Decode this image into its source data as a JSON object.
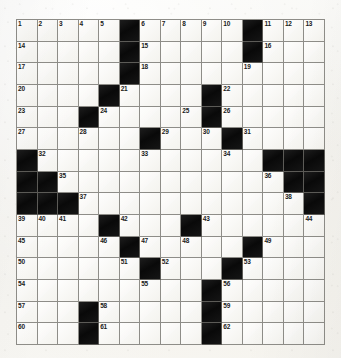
{
  "puzzle": {
    "title": "Crossword Puzzle Grid",
    "rows": 15,
    "columns": 15,
    "block_color": "#111111",
    "cell_color": "#f6f5f1",
    "grid_line_color": "#8e8d88",
    "paper_color": "#f7f6f2",
    "clue_number_color": "#1a1a1a",
    "total_clue_numbers": 62,
    "grid": [
      [
        {
          "type": "white",
          "number": "1"
        },
        {
          "type": "white",
          "number": "2"
        },
        {
          "type": "white",
          "number": "3"
        },
        {
          "type": "white",
          "number": "4"
        },
        {
          "type": "white",
          "number": "5"
        },
        {
          "type": "block",
          "number": ""
        },
        {
          "type": "white",
          "number": "6"
        },
        {
          "type": "white",
          "number": "7"
        },
        {
          "type": "white",
          "number": "8"
        },
        {
          "type": "white",
          "number": "9"
        },
        {
          "type": "white",
          "number": "10"
        },
        {
          "type": "block",
          "number": ""
        },
        {
          "type": "white",
          "number": "11"
        },
        {
          "type": "white",
          "number": "12"
        },
        {
          "type": "white",
          "number": "13"
        }
      ],
      [
        {
          "type": "white",
          "number": "14"
        },
        {
          "type": "white",
          "number": ""
        },
        {
          "type": "white",
          "number": ""
        },
        {
          "type": "white",
          "number": ""
        },
        {
          "type": "white",
          "number": ""
        },
        {
          "type": "block",
          "number": ""
        },
        {
          "type": "white",
          "number": "15"
        },
        {
          "type": "white",
          "number": ""
        },
        {
          "type": "white",
          "number": ""
        },
        {
          "type": "white",
          "number": ""
        },
        {
          "type": "white",
          "number": ""
        },
        {
          "type": "block",
          "number": ""
        },
        {
          "type": "white",
          "number": "16"
        },
        {
          "type": "white",
          "number": ""
        },
        {
          "type": "white",
          "number": ""
        }
      ],
      [
        {
          "type": "white",
          "number": "17"
        },
        {
          "type": "white",
          "number": ""
        },
        {
          "type": "white",
          "number": ""
        },
        {
          "type": "white",
          "number": ""
        },
        {
          "type": "white",
          "number": ""
        },
        {
          "type": "block",
          "number": ""
        },
        {
          "type": "white",
          "number": "18"
        },
        {
          "type": "white",
          "number": ""
        },
        {
          "type": "white",
          "number": ""
        },
        {
          "type": "white",
          "number": ""
        },
        {
          "type": "white",
          "number": ""
        },
        {
          "type": "white",
          "number": "19"
        },
        {
          "type": "white",
          "number": ""
        },
        {
          "type": "white",
          "number": ""
        },
        {
          "type": "white",
          "number": ""
        }
      ],
      [
        {
          "type": "white",
          "number": "20"
        },
        {
          "type": "white",
          "number": ""
        },
        {
          "type": "white",
          "number": ""
        },
        {
          "type": "white",
          "number": ""
        },
        {
          "type": "block",
          "number": ""
        },
        {
          "type": "white",
          "number": "21"
        },
        {
          "type": "white",
          "number": ""
        },
        {
          "type": "white",
          "number": ""
        },
        {
          "type": "white",
          "number": ""
        },
        {
          "type": "block",
          "number": ""
        },
        {
          "type": "white",
          "number": "22"
        },
        {
          "type": "white",
          "number": ""
        },
        {
          "type": "white",
          "number": ""
        },
        {
          "type": "white",
          "number": ""
        },
        {
          "type": "white",
          "number": ""
        }
      ],
      [
        {
          "type": "white",
          "number": "23"
        },
        {
          "type": "white",
          "number": ""
        },
        {
          "type": "white",
          "number": ""
        },
        {
          "type": "block",
          "number": ""
        },
        {
          "type": "white",
          "number": "24"
        },
        {
          "type": "white",
          "number": ""
        },
        {
          "type": "white",
          "number": ""
        },
        {
          "type": "white",
          "number": ""
        },
        {
          "type": "white",
          "number": "25"
        },
        {
          "type": "block",
          "number": ""
        },
        {
          "type": "white",
          "number": "26"
        },
        {
          "type": "white",
          "number": ""
        },
        {
          "type": "white",
          "number": ""
        },
        {
          "type": "white",
          "number": ""
        },
        {
          "type": "white",
          "number": ""
        }
      ],
      [
        {
          "type": "white",
          "number": "27"
        },
        {
          "type": "white",
          "number": ""
        },
        {
          "type": "white",
          "number": ""
        },
        {
          "type": "white",
          "number": "28"
        },
        {
          "type": "white",
          "number": ""
        },
        {
          "type": "white",
          "number": ""
        },
        {
          "type": "block",
          "number": ""
        },
        {
          "type": "white",
          "number": "29"
        },
        {
          "type": "white",
          "number": ""
        },
        {
          "type": "white",
          "number": "30"
        },
        {
          "type": "block",
          "number": ""
        },
        {
          "type": "white",
          "number": "31"
        },
        {
          "type": "white",
          "number": ""
        },
        {
          "type": "white",
          "number": ""
        },
        {
          "type": "white",
          "number": ""
        }
      ],
      [
        {
          "type": "block",
          "number": ""
        },
        {
          "type": "white",
          "number": "32"
        },
        {
          "type": "white",
          "number": ""
        },
        {
          "type": "white",
          "number": ""
        },
        {
          "type": "white",
          "number": ""
        },
        {
          "type": "white",
          "number": ""
        },
        {
          "type": "white",
          "number": "33"
        },
        {
          "type": "white",
          "number": ""
        },
        {
          "type": "white",
          "number": ""
        },
        {
          "type": "white",
          "number": ""
        },
        {
          "type": "white",
          "number": "34"
        },
        {
          "type": "white",
          "number": ""
        },
        {
          "type": "block",
          "number": ""
        },
        {
          "type": "block",
          "number": ""
        },
        {
          "type": "block",
          "number": ""
        }
      ],
      [
        {
          "type": "block",
          "number": ""
        },
        {
          "type": "block",
          "number": ""
        },
        {
          "type": "white",
          "number": "35"
        },
        {
          "type": "white",
          "number": ""
        },
        {
          "type": "white",
          "number": ""
        },
        {
          "type": "white",
          "number": ""
        },
        {
          "type": "white",
          "number": ""
        },
        {
          "type": "white",
          "number": ""
        },
        {
          "type": "white",
          "number": ""
        },
        {
          "type": "white",
          "number": ""
        },
        {
          "type": "white",
          "number": ""
        },
        {
          "type": "white",
          "number": ""
        },
        {
          "type": "white",
          "number": "36"
        },
        {
          "type": "block",
          "number": ""
        },
        {
          "type": "block",
          "number": ""
        }
      ],
      [
        {
          "type": "block",
          "number": ""
        },
        {
          "type": "block",
          "number": ""
        },
        {
          "type": "block",
          "number": ""
        },
        {
          "type": "white",
          "number": "37"
        },
        {
          "type": "white",
          "number": ""
        },
        {
          "type": "white",
          "number": ""
        },
        {
          "type": "white",
          "number": ""
        },
        {
          "type": "white",
          "number": ""
        },
        {
          "type": "white",
          "number": ""
        },
        {
          "type": "white",
          "number": ""
        },
        {
          "type": "white",
          "number": ""
        },
        {
          "type": "white",
          "number": ""
        },
        {
          "type": "white",
          "number": ""
        },
        {
          "type": "white",
          "number": "38"
        },
        {
          "type": "block",
          "number": ""
        }
      ],
      [
        {
          "type": "white",
          "number": "39"
        },
        {
          "type": "white",
          "number": "40"
        },
        {
          "type": "white",
          "number": "41"
        },
        {
          "type": "white",
          "number": ""
        },
        {
          "type": "block",
          "number": ""
        },
        {
          "type": "white",
          "number": "42"
        },
        {
          "type": "white",
          "number": ""
        },
        {
          "type": "white",
          "number": ""
        },
        {
          "type": "block",
          "number": ""
        },
        {
          "type": "white",
          "number": "43"
        },
        {
          "type": "white",
          "number": ""
        },
        {
          "type": "white",
          "number": ""
        },
        {
          "type": "white",
          "number": ""
        },
        {
          "type": "white",
          "number": ""
        },
        {
          "type": "white",
          "number": "44"
        }
      ],
      [
        {
          "type": "white",
          "number": "45"
        },
        {
          "type": "white",
          "number": ""
        },
        {
          "type": "white",
          "number": ""
        },
        {
          "type": "white",
          "number": ""
        },
        {
          "type": "white",
          "number": "46"
        },
        {
          "type": "block",
          "number": ""
        },
        {
          "type": "white",
          "number": "47"
        },
        {
          "type": "white",
          "number": ""
        },
        {
          "type": "white",
          "number": "48"
        },
        {
          "type": "white",
          "number": ""
        },
        {
          "type": "white",
          "number": ""
        },
        {
          "type": "block",
          "number": ""
        },
        {
          "type": "white",
          "number": "49"
        },
        {
          "type": "white",
          "number": ""
        },
        {
          "type": "white",
          "number": ""
        }
      ],
      [
        {
          "type": "white",
          "number": "50"
        },
        {
          "type": "white",
          "number": ""
        },
        {
          "type": "white",
          "number": ""
        },
        {
          "type": "white",
          "number": ""
        },
        {
          "type": "white",
          "number": ""
        },
        {
          "type": "white",
          "number": "51"
        },
        {
          "type": "block",
          "number": ""
        },
        {
          "type": "white",
          "number": "52"
        },
        {
          "type": "white",
          "number": ""
        },
        {
          "type": "white",
          "number": ""
        },
        {
          "type": "block",
          "number": ""
        },
        {
          "type": "white",
          "number": "53"
        },
        {
          "type": "white",
          "number": ""
        },
        {
          "type": "white",
          "number": ""
        },
        {
          "type": "white",
          "number": ""
        }
      ],
      [
        {
          "type": "white",
          "number": "54"
        },
        {
          "type": "white",
          "number": ""
        },
        {
          "type": "white",
          "number": ""
        },
        {
          "type": "white",
          "number": ""
        },
        {
          "type": "white",
          "number": ""
        },
        {
          "type": "white",
          "number": ""
        },
        {
          "type": "white",
          "number": "55"
        },
        {
          "type": "white",
          "number": ""
        },
        {
          "type": "white",
          "number": ""
        },
        {
          "type": "block",
          "number": ""
        },
        {
          "type": "white",
          "number": "56"
        },
        {
          "type": "white",
          "number": ""
        },
        {
          "type": "white",
          "number": ""
        },
        {
          "type": "white",
          "number": ""
        },
        {
          "type": "white",
          "number": ""
        }
      ],
      [
        {
          "type": "white",
          "number": "57"
        },
        {
          "type": "white",
          "number": ""
        },
        {
          "type": "white",
          "number": ""
        },
        {
          "type": "block",
          "number": ""
        },
        {
          "type": "white",
          "number": "58"
        },
        {
          "type": "white",
          "number": ""
        },
        {
          "type": "white",
          "number": ""
        },
        {
          "type": "white",
          "number": ""
        },
        {
          "type": "white",
          "number": ""
        },
        {
          "type": "block",
          "number": ""
        },
        {
          "type": "white",
          "number": "59"
        },
        {
          "type": "white",
          "number": ""
        },
        {
          "type": "white",
          "number": ""
        },
        {
          "type": "white",
          "number": ""
        },
        {
          "type": "white",
          "number": ""
        }
      ],
      [
        {
          "type": "white",
          "number": "60"
        },
        {
          "type": "white",
          "number": ""
        },
        {
          "type": "white",
          "number": ""
        },
        {
          "type": "block",
          "number": ""
        },
        {
          "type": "white",
          "number": "61"
        },
        {
          "type": "white",
          "number": ""
        },
        {
          "type": "white",
          "number": ""
        },
        {
          "type": "white",
          "number": ""
        },
        {
          "type": "white",
          "number": ""
        },
        {
          "type": "block",
          "number": ""
        },
        {
          "type": "white",
          "number": "62"
        },
        {
          "type": "white",
          "number": ""
        },
        {
          "type": "white",
          "number": ""
        },
        {
          "type": "white",
          "number": ""
        },
        {
          "type": "white",
          "number": ""
        }
      ]
    ]
  }
}
